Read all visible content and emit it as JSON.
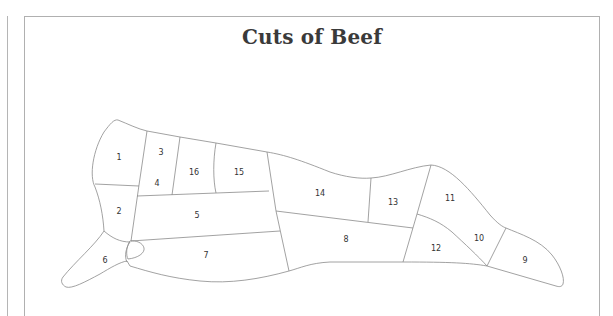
{
  "title": "Cuts of Beef",
  "diagram": {
    "line_color": "#8a8a8a",
    "cuts": [
      {
        "id": 1,
        "label": "1"
      },
      {
        "id": 2,
        "label": "2"
      },
      {
        "id": 3,
        "label": "3"
      },
      {
        "id": 4,
        "label": "4"
      },
      {
        "id": 5,
        "label": "5"
      },
      {
        "id": 6,
        "label": "6"
      },
      {
        "id": 7,
        "label": "7"
      },
      {
        "id": 8,
        "label": "8"
      },
      {
        "id": 9,
        "label": "9"
      },
      {
        "id": 10,
        "label": "10"
      },
      {
        "id": 11,
        "label": "11"
      },
      {
        "id": 12,
        "label": "12"
      },
      {
        "id": 13,
        "label": "13"
      },
      {
        "id": 14,
        "label": "14"
      },
      {
        "id": 15,
        "label": "15"
      },
      {
        "id": 16,
        "label": "16"
      }
    ]
  }
}
